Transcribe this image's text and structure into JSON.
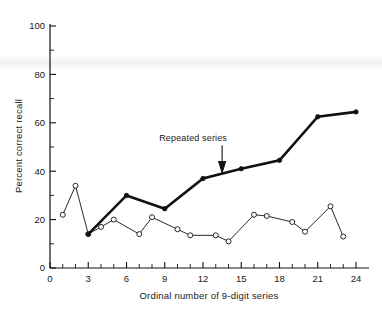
{
  "chart_data": {
    "type": "line",
    "title": "",
    "xlabel": "Ordinal number of 9-digit series",
    "ylabel": "Percent correct recall",
    "xlim": [
      0,
      25
    ],
    "ylim": [
      0,
      105
    ],
    "xticks": [
      0,
      3,
      6,
      9,
      12,
      15,
      18,
      21,
      24
    ],
    "xtick_labels": [
      "0",
      "3",
      "6",
      "9",
      "12",
      "15",
      "18",
      "21",
      "24"
    ],
    "x_minor_step": 1,
    "yticks": [
      0,
      20,
      40,
      60,
      80,
      100
    ],
    "ytick_labels": [
      "0",
      "20",
      "40",
      "60",
      "80",
      "100"
    ],
    "y_minor_step": 10,
    "grid": false,
    "legend": "none",
    "series": [
      {
        "name": "Repeated series",
        "marker": "filled-circle",
        "line": "thick",
        "x": [
          3,
          6,
          9,
          12,
          15,
          18,
          21,
          24
        ],
        "values": [
          14,
          30,
          24.5,
          37,
          41,
          44.5,
          62.5,
          64.5
        ]
      },
      {
        "name": "Non-repeated series",
        "marker": "open-circle",
        "line": "thin",
        "x": [
          1,
          2,
          3,
          4,
          5,
          7,
          8,
          10,
          11,
          13,
          14,
          16,
          17,
          19,
          20,
          22,
          23
        ],
        "values": [
          22,
          34,
          14,
          17,
          20,
          14,
          21,
          16,
          13.5,
          13.5,
          11,
          22,
          21.5,
          19,
          15,
          25.5,
          13
        ]
      }
    ],
    "annotations": [
      {
        "text": "Repeated series",
        "points_to_x": 13.5,
        "points_to_y": 39
      }
    ]
  },
  "axis_labels": {
    "x_title": "Ordinal number of 9-digit series",
    "y_title": "Percent correct recall"
  },
  "colors": {
    "ink": "#111111",
    "background": "#ffffff"
  }
}
